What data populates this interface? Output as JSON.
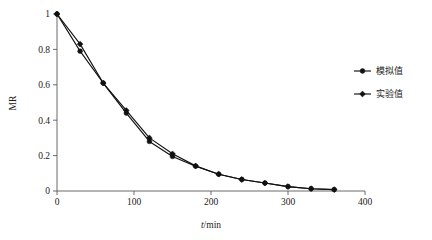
{
  "chart_data": {
    "type": "line",
    "title": "",
    "xlabel": "t/min",
    "ylabel": "MR",
    "xlim": [
      0,
      400
    ],
    "ylim": [
      0,
      1
    ],
    "grid": false,
    "legend_position": "right",
    "x": [
      0,
      30,
      60,
      90,
      120,
      150,
      180,
      210,
      240,
      270,
      300,
      330,
      360
    ],
    "xticks": [
      "0",
      "100",
      "200",
      "300",
      "400"
    ],
    "xtick_values": [
      0,
      100,
      200,
      300,
      400
    ],
    "yticks": [
      "0",
      "0.2",
      "0.4",
      "0.6",
      "0.8",
      "1"
    ],
    "ytick_values": [
      0,
      0.2,
      0.4,
      0.6,
      0.8,
      1
    ],
    "series": [
      {
        "name": "模拟值",
        "marker": "circle",
        "values": [
          1.0,
          0.79,
          0.61,
          0.44,
          0.28,
          0.195,
          0.14,
          0.095,
          0.065,
          0.045,
          0.025,
          0.013,
          0.008
        ]
      },
      {
        "name": "实验值",
        "marker": "diamond",
        "values": [
          1.0,
          0.83,
          0.61,
          0.455,
          0.3,
          0.21,
          0.142,
          0.095,
          0.065,
          0.045,
          0.025,
          0.013,
          0.008
        ]
      }
    ]
  },
  "legend": {
    "items": [
      {
        "label": "模拟值",
        "marker": "circle"
      },
      {
        "label": "实验值",
        "marker": "diamond"
      }
    ]
  },
  "axes": {
    "y_label": "MR",
    "x_label_italic": "t",
    "x_label_rest": "/min"
  },
  "colors": {
    "axis": "#5a5a5a",
    "series": "#111111",
    "background": "#ffffff",
    "text": "#1a1a1a"
  }
}
